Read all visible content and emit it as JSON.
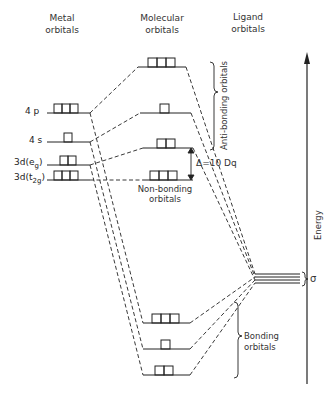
{
  "headers": {
    "metal": [
      "Metal",
      "orbitals"
    ],
    "molecular": [
      "Molecular",
      "orbitals"
    ],
    "ligand": [
      "Ligand",
      "orbitals"
    ]
  },
  "metal_levels": [
    {
      "label": "4 p",
      "boxes": 3
    },
    {
      "label": "4 s",
      "boxes": 1
    },
    {
      "label": "3d (eg)",
      "boxes": 2
    },
    {
      "label": "3d (t2g)",
      "boxes": 3
    }
  ],
  "annotations": {
    "anti_bonding": "Anti-bonding orbitals",
    "non_bonding": [
      "Non-bonding",
      "orbitals"
    ],
    "delta": "Δ=10 Dq",
    "bonding": [
      "Bonding",
      "orbitals"
    ],
    "sigma": "σ",
    "energy": "Energy"
  },
  "caption": "Fig. 2.1  Energy level diagram..."
}
